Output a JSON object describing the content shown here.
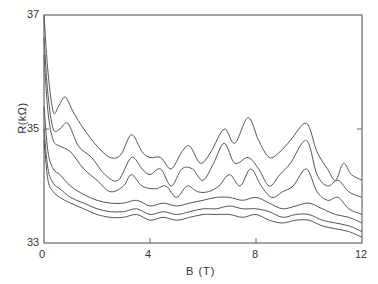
{
  "chart_data": {
    "type": "line",
    "title": "",
    "xlabel": "B (T)",
    "ylabel": "R(kΩ)",
    "xlim": [
      0,
      12
    ],
    "ylim": [
      33,
      37
    ],
    "xticks": [
      0,
      4,
      8,
      12
    ],
    "yticks": [
      33,
      35,
      37
    ],
    "xtick_labels": [
      "0",
      "4",
      "8",
      "12"
    ],
    "ytick_labels": [
      "33",
      "35",
      "37"
    ],
    "grid": false,
    "legend": null,
    "line_color": "#555555",
    "series": [
      {
        "name": "curve-1",
        "x": [
          0,
          0.15,
          0.35,
          0.55,
          0.8,
          1.1,
          1.5,
          2.0,
          2.5,
          2.9,
          3.3,
          3.7,
          4.0,
          4.4,
          4.8,
          5.2,
          5.5,
          5.9,
          6.3,
          6.8,
          7.2,
          7.7,
          8.1,
          8.5,
          8.9,
          9.3,
          9.9,
          10.3,
          10.7,
          11.0,
          11.3,
          11.6,
          12.0
        ],
        "y": [
          37.0,
          36.0,
          35.3,
          35.4,
          35.56,
          35.3,
          35.0,
          34.7,
          34.5,
          34.55,
          34.9,
          34.6,
          34.5,
          34.5,
          34.3,
          34.6,
          34.7,
          34.4,
          34.6,
          35.0,
          34.75,
          35.2,
          34.8,
          34.5,
          34.6,
          34.8,
          35.1,
          34.6,
          34.3,
          34.1,
          34.4,
          34.2,
          34.1
        ]
      },
      {
        "name": "curve-2",
        "x": [
          0,
          0.15,
          0.35,
          0.6,
          0.9,
          1.3,
          1.8,
          2.3,
          2.8,
          3.3,
          3.7,
          4.0,
          4.4,
          4.8,
          5.2,
          5.6,
          6.0,
          6.4,
          6.8,
          7.2,
          7.7,
          8.1,
          8.5,
          8.9,
          9.3,
          9.9,
          10.3,
          10.7,
          11.1,
          11.5,
          12.0
        ],
        "y": [
          36.6,
          35.6,
          35.0,
          35.0,
          35.1,
          34.7,
          34.5,
          34.2,
          34.1,
          34.5,
          34.3,
          34.2,
          34.3,
          34.0,
          34.3,
          34.3,
          34.1,
          34.4,
          34.75,
          34.4,
          34.5,
          34.3,
          34.0,
          34.2,
          34.4,
          34.8,
          34.2,
          34.0,
          34.1,
          33.9,
          33.8
        ]
      },
      {
        "name": "curve-3",
        "x": [
          0,
          0.15,
          0.35,
          0.6,
          1.0,
          1.5,
          2.0,
          2.5,
          3.0,
          3.3,
          3.7,
          4.2,
          4.6,
          5.0,
          5.4,
          5.8,
          6.2,
          6.6,
          7.0,
          7.4,
          7.8,
          8.2,
          8.6,
          9.0,
          9.4,
          9.9,
          10.3,
          10.7,
          11.1,
          11.5,
          12.0
        ],
        "y": [
          36.3,
          35.3,
          34.8,
          34.7,
          34.6,
          34.3,
          34.1,
          33.9,
          34.0,
          34.2,
          34.0,
          33.95,
          34.0,
          33.8,
          34.0,
          33.9,
          33.9,
          34.0,
          34.2,
          34.0,
          34.3,
          34.0,
          33.8,
          33.9,
          34.0,
          34.3,
          33.9,
          33.75,
          33.8,
          33.6,
          33.5
        ]
      },
      {
        "name": "curve-4",
        "x": [
          0,
          0.15,
          0.35,
          0.6,
          1.0,
          1.5,
          2.0,
          2.5,
          3.0,
          3.5,
          4.0,
          4.5,
          5.0,
          5.5,
          6.0,
          6.5,
          7.0,
          7.5,
          8.0,
          8.5,
          9.0,
          9.5,
          10.0,
          10.5,
          11.0,
          11.5,
          12.0
        ],
        "y": [
          35.4,
          34.6,
          34.3,
          34.2,
          34.0,
          33.85,
          33.75,
          33.7,
          33.7,
          33.75,
          33.65,
          33.7,
          33.65,
          33.7,
          33.75,
          33.8,
          33.8,
          33.75,
          33.8,
          33.7,
          33.6,
          33.65,
          33.7,
          33.6,
          33.5,
          33.45,
          33.35
        ]
      },
      {
        "name": "curve-5",
        "x": [
          0,
          0.15,
          0.35,
          0.6,
          1.0,
          1.5,
          2.0,
          2.5,
          3.0,
          3.5,
          4.0,
          4.5,
          5.0,
          5.5,
          6.0,
          6.5,
          7.0,
          7.5,
          8.0,
          8.5,
          9.0,
          9.5,
          10.0,
          10.5,
          11.0,
          11.5,
          12.0
        ],
        "y": [
          35.0,
          34.3,
          34.05,
          33.95,
          33.8,
          33.7,
          33.6,
          33.55,
          33.55,
          33.6,
          33.5,
          33.55,
          33.5,
          33.55,
          33.6,
          33.6,
          33.65,
          33.6,
          33.6,
          33.55,
          33.45,
          33.5,
          33.5,
          33.4,
          33.35,
          33.3,
          33.2
        ]
      },
      {
        "name": "curve-6",
        "x": [
          0,
          0.15,
          0.35,
          0.6,
          1.0,
          1.5,
          2.0,
          2.5,
          3.0,
          3.5,
          4.0,
          4.5,
          5.0,
          5.5,
          6.0,
          6.5,
          7.0,
          7.5,
          8.0,
          8.5,
          9.0,
          9.5,
          10.0,
          10.5,
          11.0,
          11.5,
          12.0
        ],
        "y": [
          34.8,
          34.1,
          33.9,
          33.8,
          33.7,
          33.6,
          33.5,
          33.45,
          33.45,
          33.5,
          33.4,
          33.45,
          33.4,
          33.45,
          33.5,
          33.5,
          33.5,
          33.45,
          33.5,
          33.4,
          33.35,
          33.4,
          33.4,
          33.3,
          33.25,
          33.2,
          33.1
        ]
      }
    ]
  },
  "axes": {
    "x_label": "B (T)",
    "y_label": "R(kΩ)",
    "x_ticks": [
      "0",
      "4",
      "8",
      "12"
    ],
    "y_ticks": [
      "33",
      "35",
      "37"
    ]
  }
}
